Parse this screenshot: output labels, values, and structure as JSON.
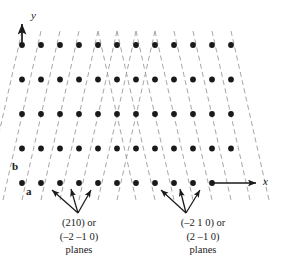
{
  "figure": {
    "name": "crystallographic-planes-lattice-diagram",
    "background_color": "#ffffff",
    "dot_color": "#1a1a1a",
    "plane_line_color": "#9a9a9a",
    "arrow_color": "#1a1a1a"
  },
  "axes": {
    "x_label": "x",
    "y_label": "y"
  },
  "vectors": {
    "a_label": "a",
    "b_label": "b"
  },
  "captions": {
    "left": {
      "line1": "(210) or",
      "line2": "(–2 –1 0)",
      "line3": "planes"
    },
    "right": {
      "line1": "(–2 1 0) or",
      "line2": "(2 –1 0)",
      "line3": "planes"
    }
  },
  "lattice": {
    "rows": 5,
    "columns": 12,
    "x_start": 22,
    "x_step": 19.0,
    "y_start": 45,
    "y_step": 34.5,
    "dot_radius": 2.9
  },
  "planes": {
    "left_family": {
      "slope_sign": "positive",
      "description": "dashed lines rising to the right",
      "count": 11
    },
    "right_family": {
      "slope_sign": "negative",
      "description": "dashed lines falling to the right",
      "count": 11
    }
  },
  "pointer_arrows": {
    "left_group": {
      "apex_x": 78,
      "apex_y": 213,
      "tips": [
        [
          50,
          189
        ],
        [
          70,
          187
        ],
        [
          92,
          189
        ]
      ]
    },
    "right_group": {
      "apex_x": 186,
      "apex_y": 213,
      "tips": [
        [
          160,
          189
        ],
        [
          180,
          187
        ],
        [
          201,
          189
        ]
      ]
    }
  }
}
